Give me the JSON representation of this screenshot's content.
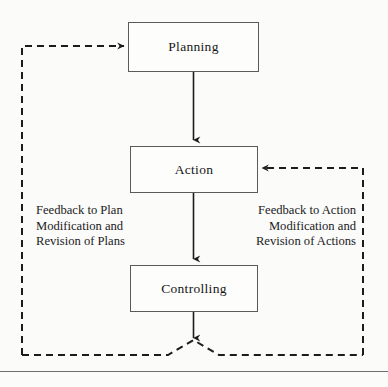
{
  "diagram": {
    "nodes": [
      {
        "id": "planning",
        "label": "Planning"
      },
      {
        "id": "action",
        "label": "Action"
      },
      {
        "id": "controlling",
        "label": "Controlling"
      }
    ],
    "labels": {
      "feedback_to_plan": {
        "line1": "Feedback to Plan",
        "line2": "Modification and",
        "line3": "Revision of Plans"
      },
      "feedback_to_action": {
        "line1": "Feedback to Action",
        "line2": "Modification and",
        "line3": "Revision of Actions"
      }
    },
    "connectors": [
      {
        "id": "planning-to-action",
        "style": "solid",
        "from": "planning",
        "to": "action",
        "arrow": "down"
      },
      {
        "id": "action-to-controlling",
        "style": "solid",
        "from": "action",
        "to": "controlling",
        "arrow": "down"
      },
      {
        "id": "controlling-to-junction",
        "style": "solid",
        "from": "controlling",
        "to": "junction",
        "arrow": "down"
      },
      {
        "id": "feedback-loop-to-planning",
        "style": "dashed",
        "from": "junction",
        "to": "planning",
        "arrow": "right"
      },
      {
        "id": "feedback-loop-to-action",
        "style": "dashed",
        "from": "junction",
        "to": "action",
        "arrow": "left"
      }
    ],
    "colors": {
      "background": "#fbfbfa",
      "box_border": "#5a5a5a",
      "box_fill": "#fdfdfc",
      "line": "#1c1c1c",
      "text": "#161616",
      "rule": "#6f6f6f"
    }
  }
}
